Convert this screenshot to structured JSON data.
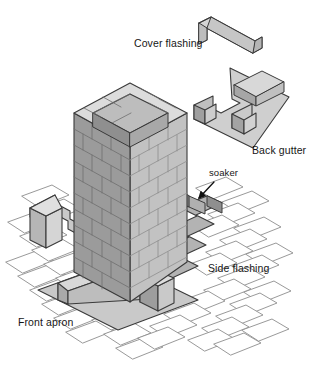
{
  "diagram": {
    "projection": "isometric",
    "background_color": "#ffffff",
    "line_color": "#3a3a3a",
    "text_color": "#161616"
  },
  "labels": {
    "cover_flashing": "Cover flashing",
    "back_gutter": "Back gutter",
    "soaker": "soaker",
    "side_flashing": "Side flashing",
    "front_apron": "Front apron"
  },
  "parts": [
    {
      "id": "cover-flashing",
      "name": "Cover flashing",
      "shape": "U-shaped channel strip",
      "position": "top-right",
      "fill": "#d6d6d6"
    },
    {
      "id": "back-gutter",
      "name": "Back gutter",
      "shape": "flat tray with raised ridge and folded end tabs",
      "position": "upper-right",
      "fill": "#cfcfcf"
    },
    {
      "id": "chimney-stack",
      "name": "Brick chimney stack",
      "shape": "open-top rectangular brick column",
      "position": "center",
      "courses": 9,
      "left_face_fill": "#9b9b9b",
      "right_face_fill": "#c2c2c2",
      "top_face_fill": "#dcdcdc"
    },
    {
      "id": "soaker",
      "name": "soaker",
      "shape": "small interleaved sheet at tile/chimney junction",
      "position": "right of stack, mid height"
    },
    {
      "id": "side-flashing-right",
      "name": "Side flashing",
      "shape": "stepped zig-zag strip",
      "position": "right slope",
      "steps": 4,
      "fill": "#b4b4b4"
    },
    {
      "id": "side-flashing-left",
      "name": "Side flashing",
      "shape": "stepped zig-zag strip",
      "position": "left slope",
      "steps": 3,
      "fill": "#c6c6c6"
    },
    {
      "id": "front-apron",
      "name": "Front apron",
      "shape": "flat plate with upstand fold",
      "position": "lower-left front",
      "fill": "#c4c4c4"
    },
    {
      "id": "roof-tiles",
      "name": "Roof tiles",
      "shape": "overlapping flat parallelogram tiles",
      "position": "surrounding base",
      "fill": "#ffffff",
      "outline": "#8a8a8a"
    }
  ],
  "annotation": {
    "leader": "arrow from soaker label pointing down-left to the soaker sheet"
  }
}
